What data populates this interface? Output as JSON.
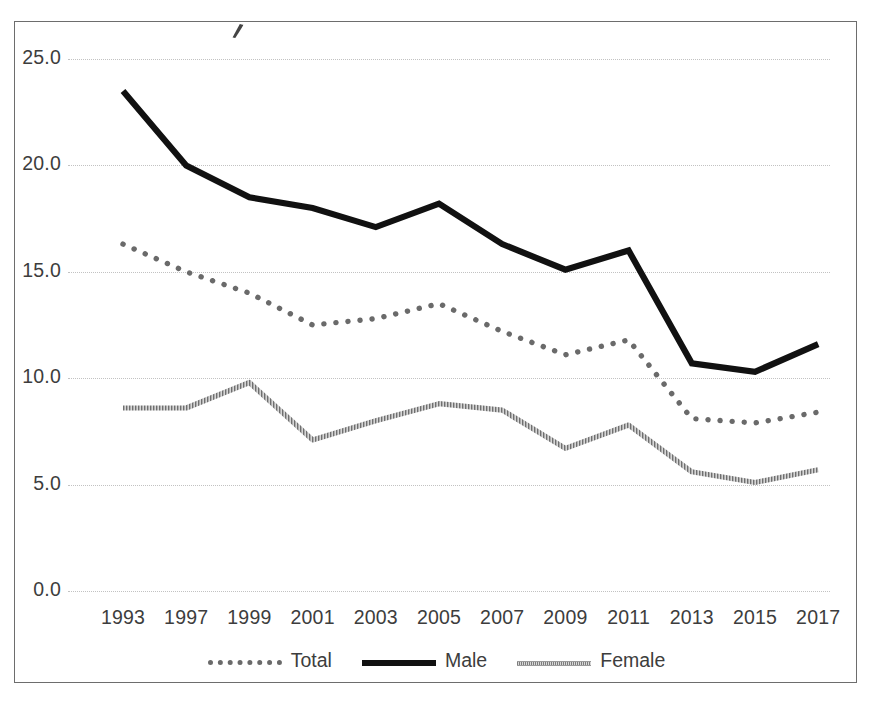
{
  "chart_data": {
    "type": "line",
    "title": "",
    "xlabel": "",
    "ylabel": "",
    "grid": true,
    "legend_position": "bottom-center",
    "categories": [
      "1993",
      "1997",
      "1999",
      "2001",
      "2003",
      "2005",
      "2007",
      "2009",
      "2011",
      "2013",
      "2015",
      "2017"
    ],
    "ylim": [
      0.0,
      25.0
    ],
    "y_ticks": [
      "0.0",
      "5.0",
      "10.0",
      "15.0",
      "20.0",
      "25.0"
    ],
    "y_tick_values": [
      0.0,
      5.0,
      10.0,
      15.0,
      20.0,
      25.0
    ],
    "series": [
      {
        "name": "Total",
        "style": "dotted",
        "color": "#6a6a6a",
        "values": [
          16.3,
          15.0,
          14.0,
          12.5,
          12.8,
          13.5,
          12.2,
          11.1,
          11.8,
          8.1,
          7.9,
          8.4
        ]
      },
      {
        "name": "Male",
        "style": "solid-thick",
        "color": "#111111",
        "values": [
          23.5,
          20.0,
          18.5,
          18.0,
          17.1,
          18.2,
          16.3,
          15.1,
          16.0,
          10.7,
          10.3,
          11.6
        ]
      },
      {
        "name": "Female",
        "style": "textured-thin",
        "color": "#7d7d7d",
        "values": [
          8.6,
          8.6,
          9.8,
          7.1,
          8.0,
          8.8,
          8.5,
          6.7,
          7.8,
          5.6,
          5.1,
          5.7
        ]
      }
    ]
  },
  "legend": {
    "entries": [
      {
        "label": "Total"
      },
      {
        "label": "Male"
      },
      {
        "label": "Female"
      }
    ]
  }
}
